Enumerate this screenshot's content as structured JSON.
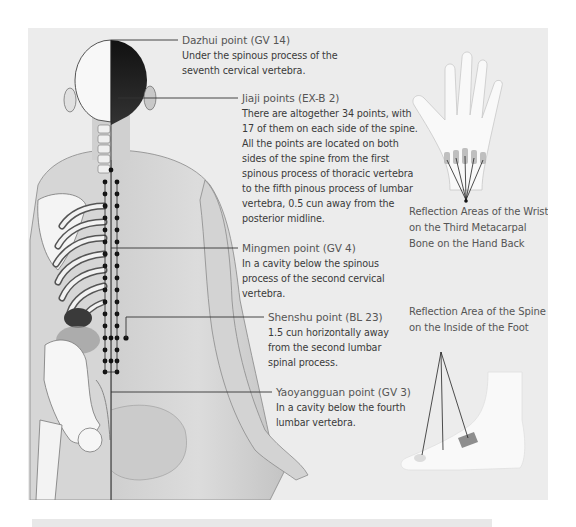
{
  "figure": {
    "accent_color": "#3a3a3a",
    "annotations": [
      {
        "id": "dazhui",
        "title": "Dazhui point (GV 14)",
        "desc": "Under the spinous process of the seventh cervical vertebra."
      },
      {
        "id": "jiaji",
        "title": "Jiaji points (EX-B 2)",
        "desc": "There are altogether 34 points, with 17 of them on each side of the spine. All the points are located on both sides of the spine from the first spinous process of thoracic vertebra to the fifth pinous process of lumbar vertebra, 0.5 cun away from the posterior midline."
      },
      {
        "id": "mingmen",
        "title": "Mingmen point (GV 4)",
        "desc": "In a cavity below the spinous process of the second cervical vertebra."
      },
      {
        "id": "shenshu",
        "title": "Shenshu point (BL 23)",
        "desc": "1.5 cun horizontally away from the second lumbar spinal process."
      },
      {
        "id": "yaoyangguan",
        "title": "Yaoyangguan point (GV 3)",
        "desc": "In a cavity below the fourth lumbar vertebra."
      }
    ],
    "insets": [
      {
        "id": "hand",
        "caption": "Reflection Areas of the Wrist on the Third Metacarpal Bone on the Hand Back"
      },
      {
        "id": "foot",
        "caption": "Reflection Area of the Spine on the Inside of the Foot"
      }
    ]
  }
}
